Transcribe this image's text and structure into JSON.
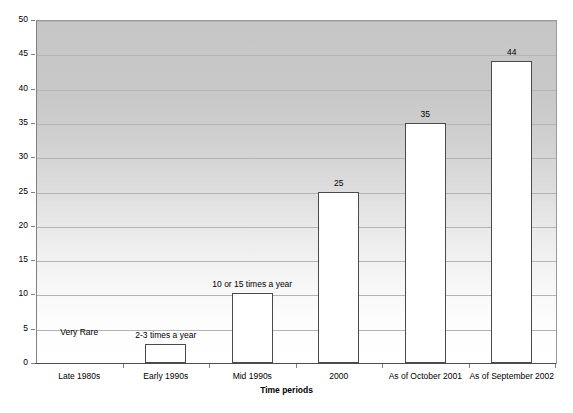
{
  "chart_data": {
    "type": "bar",
    "title": "",
    "xlabel": "Time periods",
    "ylabel": "",
    "categories": [
      "Late 1980s",
      "Early 1990s",
      "Mid 1990s",
      "2000",
      "As of October 2001",
      "As of September 2002"
    ],
    "values": [
      0,
      2.7,
      10.2,
      25,
      35,
      44
    ],
    "point_labels": [
      "Very Rare",
      "2-3 times a year",
      "10 or 15 times a year",
      "25",
      "35",
      "44"
    ],
    "ylim": [
      0,
      50
    ],
    "ytick_labels": [
      "0",
      "5",
      "10",
      "15",
      "20",
      "25",
      "30",
      "35",
      "40",
      "45",
      "50"
    ],
    "ytick_values": [
      0,
      5,
      10,
      15,
      20,
      25,
      30,
      35,
      40,
      45,
      50
    ],
    "grid": true,
    "grid_axis": "y",
    "legend": false,
    "legend_position": "none",
    "bar_fill_color": "#ffffff",
    "bar_edge_color": "#4a4a4a",
    "plot_bg_gradient_top": "#c6c6c6",
    "plot_bg_gradient_bottom": "#ffffff",
    "gridline_color": "#b4b4b4",
    "axis_color": "#4d4d4d",
    "page_bg_color": "#ffffff"
  }
}
